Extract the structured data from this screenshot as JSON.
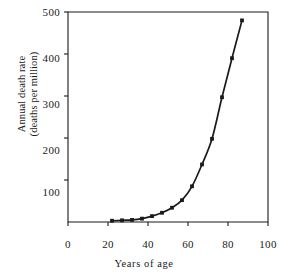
{
  "chart_data": {
    "type": "line",
    "title": "",
    "xlabel": "Years of age",
    "ylabel": "Annual death rate\n(deaths per million)",
    "xlim": [
      0,
      100
    ],
    "ylim": [
      0,
      500
    ],
    "xticks": [
      "0",
      "20",
      "40",
      "60",
      "80",
      "100"
    ],
    "xtick_values": [
      0,
      20,
      40,
      60,
      80,
      100
    ],
    "yticks": [
      "100",
      "200",
      "300",
      "400",
      "500"
    ],
    "ytick_values": [
      100,
      200,
      300,
      400,
      500
    ],
    "grid": false,
    "legend": null,
    "marker": "filled-square",
    "line_color": "#1a1a1a",
    "x": [
      22,
      27,
      32,
      37,
      42,
      47,
      52,
      57,
      62,
      67,
      72,
      77,
      82,
      87
    ],
    "values": [
      3,
      4,
      5,
      8,
      14,
      22,
      34,
      52,
      85,
      137,
      198,
      297,
      390,
      480
    ],
    "series": [
      {
        "name": "Annual death rate",
        "x": [
          22,
          27,
          32,
          37,
          42,
          47,
          52,
          57,
          62,
          67,
          72,
          77,
          82,
          87
        ],
        "values": [
          3,
          4,
          5,
          8,
          14,
          22,
          34,
          52,
          85,
          137,
          198,
          297,
          390,
          480
        ]
      }
    ]
  }
}
